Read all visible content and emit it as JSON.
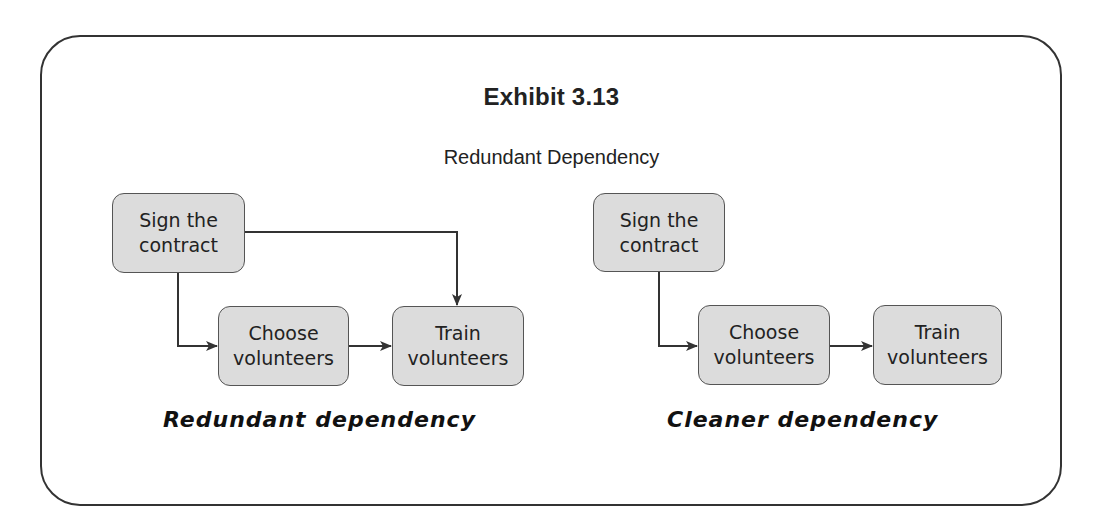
{
  "exhibit": {
    "title": "Exhibit 3.13",
    "subtitle": "Redundant Dependency"
  },
  "diagrams": [
    {
      "caption": "Redundant dependency",
      "nodes": [
        {
          "id": "sign",
          "label": "Sign the\ncontract"
        },
        {
          "id": "choose",
          "label": "Choose\nvolunteers"
        },
        {
          "id": "train",
          "label": "Train\nvolunteers"
        }
      ],
      "edges": [
        {
          "from": "sign",
          "to": "choose"
        },
        {
          "from": "choose",
          "to": "train"
        },
        {
          "from": "sign",
          "to": "train"
        }
      ]
    },
    {
      "caption": "Cleaner dependency",
      "nodes": [
        {
          "id": "sign",
          "label": "Sign the\ncontract"
        },
        {
          "id": "choose",
          "label": "Choose\nvolunteers"
        },
        {
          "id": "train",
          "label": "Train\nvolunteers"
        }
      ],
      "edges": [
        {
          "from": "sign",
          "to": "choose"
        },
        {
          "from": "choose",
          "to": "train"
        }
      ]
    }
  ],
  "colors": {
    "node_fill": "#dcdcdc",
    "node_border": "#555555",
    "line": "#333333"
  }
}
